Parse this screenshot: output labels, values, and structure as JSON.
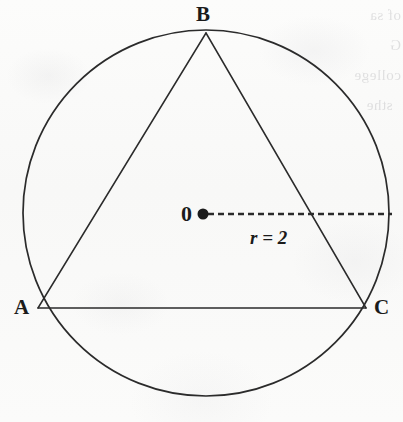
{
  "figure": {
    "type": "geometry-diagram",
    "background_color": "#fbfbfa",
    "ink_color": "#2b2b2b",
    "labels": {
      "vertex_b": "B",
      "vertex_a": "A",
      "vertex_c": "C",
      "center": "0",
      "radius": "r = 2"
    },
    "circle": {
      "center_x": 206,
      "center_y": 213,
      "radius": 183,
      "stroke_width": 1.7
    },
    "triangle": {
      "vertices": [
        {
          "name": "B",
          "x": 206,
          "y": 33
        },
        {
          "name": "A",
          "x": 38,
          "y": 308
        },
        {
          "name": "C",
          "x": 366,
          "y": 308
        }
      ],
      "stroke_width": 1.5
    },
    "radius_marker": {
      "from_x": 206,
      "from_y": 214,
      "to_x": 392,
      "to_y": 214,
      "style": "dashed",
      "dot_radius": 5.5,
      "stroke_width": 2.6,
      "dash_pattern": "6 4"
    },
    "bleed_through_text": "of sa\nG\ncollege\n  sthe\n     \n"
  }
}
